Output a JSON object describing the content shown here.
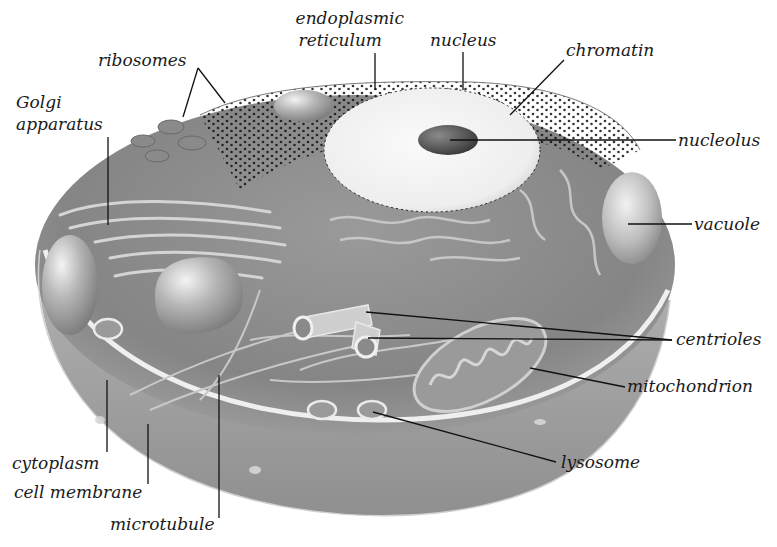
{
  "diagram": {
    "colors": {
      "background": "#ffffff",
      "cytoplasm": "#8c8c8c",
      "cytoplasm_dark": "#6e6e6e",
      "membrane_rim": "#ececec",
      "body_side": "#a9a9a9",
      "nucleus": "#f1f1f1",
      "nucleolus": "#4a4a4a",
      "organelle": "#b8b8b8",
      "leader_line": "#111111",
      "label_text": "#1a1a1a"
    },
    "labels": {
      "endoplasmic_reticulum_1": "endoplasmic",
      "endoplasmic_reticulum_2": "reticulum",
      "nucleus": "nucleus",
      "chromatin": "chromatin",
      "ribosomes": "ribosomes",
      "golgi_1": "Golgi",
      "golgi_2": "apparatus",
      "nucleolus": "nucleolus",
      "vacuole": "vacuole",
      "centrioles": "centrioles",
      "mitochondrion": "mitochondrion",
      "lysosome": "lysosome",
      "cytoplasm": "cytoplasm",
      "cell_membrane": "cell membrane",
      "microtubule": "microtubule"
    }
  }
}
